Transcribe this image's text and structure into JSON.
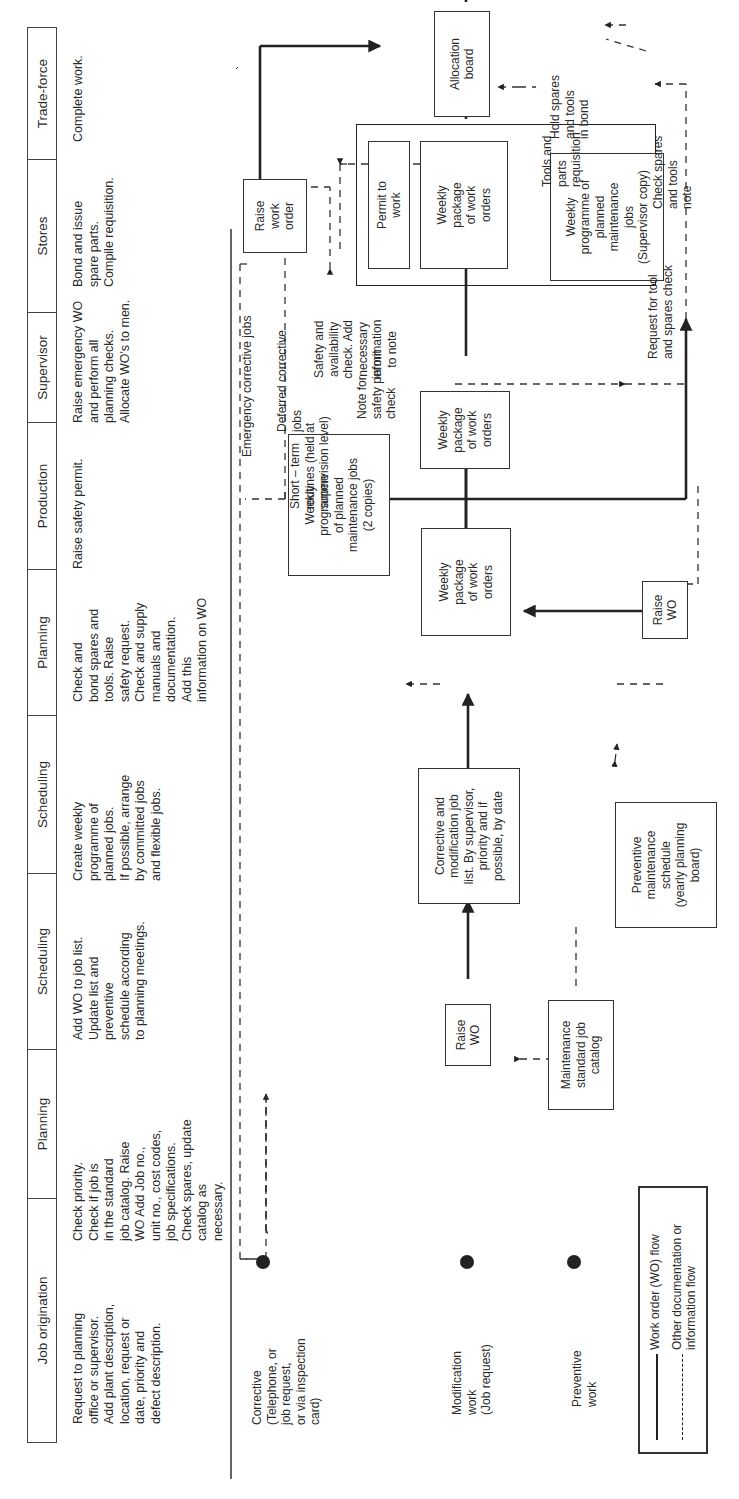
{
  "table": {
    "columns": [
      {
        "header": "Job origination",
        "description": "Request to planning\noffice or supervisor.\nAdd plant description,\nlocation, request or\ndate, priority and\ndefect description."
      },
      {
        "header": "Planning",
        "description": "Check priority.\nCheck if job is\nin the standard\njob catalog. Raise\nWO Add Job no.,\nunit no., cost codes,\njob specifications.\nCheck spares, update\ncatalog as\nnecessary."
      },
      {
        "header": "Scheduling",
        "description": "Add WO to job list.\nUpdate list and\npreventive\nschedule according\nto planning meetings."
      },
      {
        "header": "Scheduling",
        "description": "Create weekly\nprogramme of\nplanned jobs.\nIf possible, arrange\nby committed jobs\nand flexible jobs."
      },
      {
        "header": "Planning",
        "description": "Check and\nbond spares and\ntools. Raise\nsafety request.\nCheck and supply\nmanuals and\ndocumentation.\nAdd this\ninformation on WO"
      },
      {
        "header": "Production",
        "description": "Raise safety permit."
      },
      {
        "header": "Supervisor",
        "description": "Raise emergency WO\nand perform all\nplanning checks.\nAllocate WO's to men."
      },
      {
        "header": "Stores",
        "description": "Bond and issue\nspare parts.\nCompile requisition."
      },
      {
        "header": "Trade-force",
        "description": "Complete work."
      }
    ]
  },
  "sources": {
    "corrective": "Corrective\n(Telephone, or\njob request,\nor via inspection\ncard)",
    "modification": "Modification\nwork\n(Job request)",
    "preventive": "Preventive\nwork"
  },
  "nodes": {
    "raise_wo_1": "Raise\nWO",
    "catalog": "Maintenance\nstandard job\ncatalog",
    "corrective_list": "Corrective and\nmodification job\nlist. By supervisor,\npriority and if\npossible, by date",
    "pm_schedule": "Preventive\nmaintenance\nschedule\n(yearly planning\nboard)",
    "weekly_programme_2copies": "Weekly\nprogramme\nof planned\nmaintenance jobs\n(2 copies)",
    "weekly_package_1": "Weekly\npackage\nof work\norders",
    "raise_wo_2": "Raise\nWO",
    "weekly_package_2": "Weekly\npackage\nof work\norders",
    "permit_to_work": "Permit to\nwork",
    "weekly_package_3": "Weekly\npackage\nof work\norders",
    "weekly_programme_supervisor": "Weekly\nprogramme of\nplanned\nmaintenance\njobs\n(Supervisor copy)",
    "raise_work_order": "Raise\nwork\norder",
    "allocation_board": "Allocation\nboard",
    "work_order": "Work\norder"
  },
  "annotations": {
    "emergency": "Emergency corrective jobs",
    "deferred": "Deferred corrective\njobs",
    "short_term": "Short – term\nroutines (held at\nsupervision level)",
    "note_safety": "Note for\nsafety permit\ncheck",
    "safety_check": "Safety and\navailability\ncheck. Add\nnecessary\ninformation\nto note",
    "request_tool": "Request for tool\nand spares check",
    "hold_spares": "Hold spares\nand tools\nin bond",
    "check_spares": "Check spares\nand tools\nnote",
    "tools_parts": "Tools and\nparts\nrequisition"
  },
  "legend": {
    "solid": "Work order (WO) flow",
    "dashed": "Other documentation or\ninformation flow"
  }
}
